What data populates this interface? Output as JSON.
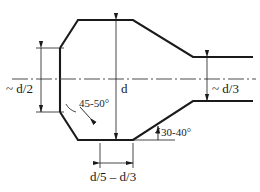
{
  "drawing": {
    "title": "Forging preform taper geometry",
    "stroke_color": "#1a1a1a",
    "thin_color": "#4d4d4d",
    "background": "#ffffff",
    "labels": {
      "left_height": "~ d/2",
      "right_height": "~ d/3",
      "center_height": "d",
      "angle_left": "45-50°",
      "angle_right": "30-40°",
      "bottom_width": "d/5 – d/3"
    }
  },
  "geometry": {
    "outline_top": [
      [
        60,
        48
      ],
      [
        78,
        20
      ],
      [
        133,
        20
      ],
      [
        193,
        57
      ],
      [
        253,
        57
      ]
    ],
    "outline_bottom": [
      [
        60,
        112
      ],
      [
        78,
        140
      ],
      [
        133,
        140
      ],
      [
        193,
        101
      ],
      [
        253,
        101
      ]
    ],
    "left_face": [
      [
        60,
        48
      ],
      [
        60,
        112
      ]
    ],
    "centerline_y": 79,
    "centerline_x": [
      12,
      256
    ]
  }
}
